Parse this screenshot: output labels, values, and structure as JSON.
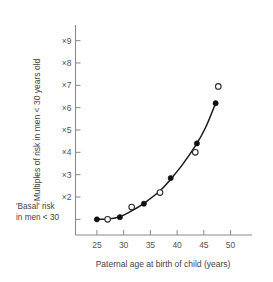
{
  "chart_data": {
    "type": "scatter",
    "title": "",
    "xlabel": "Paternal age at birth of child (years)",
    "ylabel": "Multiples of risk in men < 30 years old",
    "xlim": [
      21,
      54
    ],
    "ylim": [
      0.3,
      9.7
    ],
    "grid": false,
    "legend_position": "none",
    "xticks": [
      25,
      30,
      35,
      40,
      45,
      50
    ],
    "xtick_labels": [
      "25",
      "30",
      "35",
      "40",
      "45",
      "50"
    ],
    "yticks": [
      1,
      2,
      3,
      4,
      5,
      6,
      7,
      8,
      9
    ],
    "ytick_labels": [
      "",
      "×2",
      "×3",
      "×4",
      "×5",
      "×6",
      "×7",
      "×8",
      "×9"
    ],
    "baseline_annotation_line1": "'Basal' risk",
    "baseline_annotation_line2": "in men < 30",
    "baseline_value": 1,
    "series": [
      {
        "name": "filled-circles",
        "marker": "filled circle",
        "color": "#101010",
        "points": [
          {
            "x": 25.0,
            "y": 1.0
          },
          {
            "x": 29.3,
            "y": 1.1
          },
          {
            "x": 33.8,
            "y": 1.7
          },
          {
            "x": 38.8,
            "y": 2.85
          },
          {
            "x": 43.7,
            "y": 4.4
          },
          {
            "x": 47.2,
            "y": 6.2
          }
        ]
      },
      {
        "name": "open-circles",
        "marker": "open circle",
        "color": "#ffffff",
        "points": [
          {
            "x": 27.0,
            "y": 1.0
          },
          {
            "x": 31.5,
            "y": 1.55
          },
          {
            "x": 36.8,
            "y": 2.2
          },
          {
            "x": 43.4,
            "y": 4.0
          },
          {
            "x": 47.7,
            "y": 6.95
          }
        ]
      }
    ],
    "fit_curve": {
      "name": "fitted risk curve",
      "color": "#1a1a1a",
      "points": [
        {
          "x": 25.0,
          "y": 1.0
        },
        {
          "x": 27.0,
          "y": 1.02
        },
        {
          "x": 29.3,
          "y": 1.12
        },
        {
          "x": 31.5,
          "y": 1.38
        },
        {
          "x": 33.8,
          "y": 1.72
        },
        {
          "x": 36.8,
          "y": 2.28
        },
        {
          "x": 38.8,
          "y": 2.8
        },
        {
          "x": 41.0,
          "y": 3.45
        },
        {
          "x": 43.5,
          "y": 4.32
        },
        {
          "x": 45.3,
          "y": 5.1
        },
        {
          "x": 47.2,
          "y": 6.2
        }
      ]
    }
  }
}
